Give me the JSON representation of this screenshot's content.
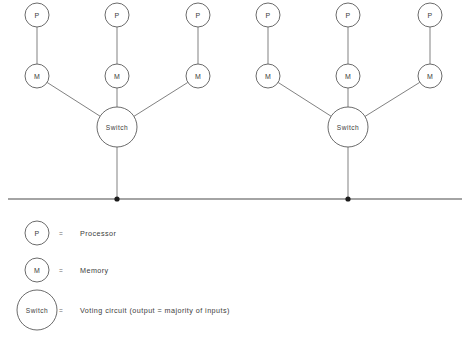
{
  "diagram": {
    "colors": {
      "background": "#ffffff",
      "node_stroke": "#5a5a5a",
      "link_stroke": "#6a6a6a",
      "bus_stroke": "#4a4a4a",
      "dot_fill": "#1c1c1c",
      "text": "#3c3c3c"
    },
    "labels": {
      "processor": "P",
      "memory": "M",
      "switch": "Switch"
    },
    "clusters": [
      {
        "name": "left-cluster",
        "switch": {
          "label": "Switch",
          "cx": 117,
          "cy": 127,
          "r": 20
        },
        "bus_dot": {
          "cx": 117,
          "cy": 199
        },
        "branches": [
          {
            "name": "left-cluster-branch-1",
            "processor": {
              "label": "P",
              "cx": 37,
              "cy": 15,
              "r": 12
            },
            "memory": {
              "label": "M",
              "cx": 37,
              "cy": 76,
              "r": 12
            }
          },
          {
            "name": "left-cluster-branch-2",
            "processor": {
              "label": "P",
              "cx": 117,
              "cy": 15,
              "r": 12
            },
            "memory": {
              "label": "M",
              "cx": 117,
              "cy": 76,
              "r": 12
            }
          },
          {
            "name": "left-cluster-branch-3",
            "processor": {
              "label": "P",
              "cx": 198,
              "cy": 15,
              "r": 12
            },
            "memory": {
              "label": "M",
              "cx": 198,
              "cy": 76,
              "r": 12
            }
          }
        ]
      },
      {
        "name": "right-cluster",
        "switch": {
          "label": "Switch",
          "cx": 348,
          "cy": 127,
          "r": 20
        },
        "bus_dot": {
          "cx": 348,
          "cy": 199
        },
        "branches": [
          {
            "name": "right-cluster-branch-1",
            "processor": {
              "label": "P",
              "cx": 268,
              "cy": 15,
              "r": 12
            },
            "memory": {
              "label": "M",
              "cx": 268,
              "cy": 76,
              "r": 12
            }
          },
          {
            "name": "right-cluster-branch-2",
            "processor": {
              "label": "P",
              "cx": 348,
              "cy": 15,
              "r": 12
            },
            "memory": {
              "label": "M",
              "cx": 348,
              "cy": 76,
              "r": 12
            }
          },
          {
            "name": "right-cluster-branch-3",
            "processor": {
              "label": "P",
              "cx": 430,
              "cy": 15,
              "r": 12
            },
            "memory": {
              "label": "M",
              "cx": 430,
              "cy": 76,
              "r": 12
            }
          }
        ]
      }
    ],
    "bus": {
      "x1": 8,
      "x2": 462,
      "y": 199
    }
  },
  "legend": {
    "equals_sign": "=",
    "rows": [
      {
        "name": "legend-row-processor",
        "symbol": "P",
        "symbol_kind": "small",
        "cx": 37,
        "cy": 233,
        "r": 12,
        "equals_x": 61,
        "text_x": 80,
        "description": "Processor"
      },
      {
        "name": "legend-row-memory",
        "symbol": "M",
        "symbol_kind": "small",
        "cx": 37,
        "cy": 270,
        "r": 12,
        "equals_x": 61,
        "text_x": 80,
        "description": "Memory"
      },
      {
        "name": "legend-row-switch",
        "symbol": "Switch",
        "symbol_kind": "large",
        "cx": 37,
        "cy": 310,
        "r": 20,
        "equals_x": 61,
        "text_x": 80,
        "description": "Voting circuit (output = majority of inputs)"
      }
    ]
  }
}
